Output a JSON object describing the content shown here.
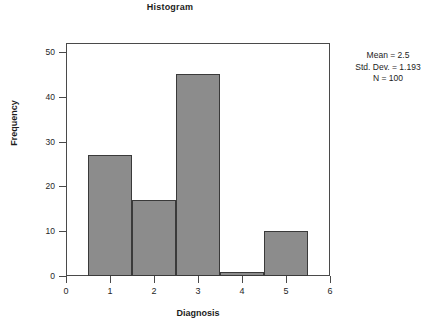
{
  "chart_data": {
    "type": "bar",
    "title": "Histogram",
    "xlabel": "Diagnosis",
    "ylabel": "Frequency",
    "categories": [
      "1",
      "2",
      "3",
      "4",
      "5"
    ],
    "values": [
      27,
      17,
      45,
      1,
      10
    ],
    "bin_width": 1,
    "bin_edges": [
      0.5,
      1.5,
      2.5,
      3.5,
      4.5,
      5.5
    ],
    "xlim": [
      0,
      6
    ],
    "ylim": [
      0,
      52
    ],
    "x_ticks": [
      "0",
      "1",
      "2",
      "3",
      "4",
      "5",
      "6"
    ],
    "x_tick_values": [
      0,
      1,
      2,
      3,
      4,
      5,
      6
    ],
    "y_ticks": [
      "0",
      "10",
      "20",
      "30",
      "40",
      "50"
    ],
    "y_tick_values": [
      0,
      10,
      20,
      30,
      40,
      50
    ],
    "grid": false,
    "legend": null,
    "bar_fill_color": "#8c8c8c",
    "bar_border_color": "#3a3a3a",
    "frame_color": "#4a4a4a",
    "background_color": "#ffffff",
    "annotations": {
      "position": "right",
      "lines": [
        "Mean = 2.5",
        "Std. Dev. = 1.193",
        "N = 100"
      ],
      "mean": "Mean = 2.5",
      "std_dev": "Std. Dev. = 1.193",
      "n": "N = 100"
    }
  }
}
